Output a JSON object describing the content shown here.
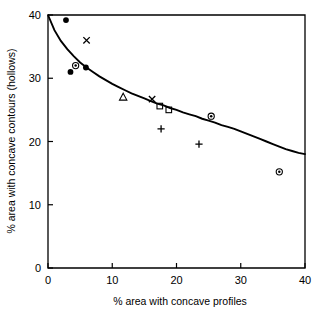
{
  "chart_data": {
    "type": "scatter",
    "title": "",
    "xlabel": "% area with concave profiles",
    "ylabel": "% area with concave contours (hollows)",
    "xlim": [
      0,
      40
    ],
    "ylim": [
      0,
      40
    ],
    "xticks": [
      0,
      10,
      20,
      30,
      40
    ],
    "yticks": [
      0,
      10,
      20,
      30,
      40
    ],
    "xtick_labels": [
      "0",
      "10",
      "20",
      "30",
      "40"
    ],
    "ytick_labels": [
      "0",
      "10",
      "20",
      "30",
      "40"
    ],
    "grid": false,
    "legend": "none",
    "points": [
      {
        "x": 2.8,
        "y": 39.2,
        "marker": "filled-circle"
      },
      {
        "x": 3.5,
        "y": 31.0,
        "marker": "filled-circle"
      },
      {
        "x": 4.3,
        "y": 32.0,
        "marker": "circle-dot"
      },
      {
        "x": 5.9,
        "y": 31.7,
        "marker": "filled-circle"
      },
      {
        "x": 6.0,
        "y": 36.0,
        "marker": "cross"
      },
      {
        "x": 11.7,
        "y": 27.0,
        "marker": "open-triangle"
      },
      {
        "x": 16.2,
        "y": 26.7,
        "marker": "cross"
      },
      {
        "x": 17.4,
        "y": 25.6,
        "marker": "open-square"
      },
      {
        "x": 18.8,
        "y": 25.0,
        "marker": "open-square"
      },
      {
        "x": 17.6,
        "y": 22.0,
        "marker": "plus"
      },
      {
        "x": 23.5,
        "y": 19.6,
        "marker": "plus"
      },
      {
        "x": 25.4,
        "y": 24.0,
        "marker": "circle-dot"
      },
      {
        "x": 36.0,
        "y": 15.2,
        "marker": "circle-dot"
      }
    ],
    "fit_curve": {
      "description": "decreasing power-law trend line",
      "points": [
        {
          "x": 0.0,
          "y": 40.0
        },
        {
          "x": 1.0,
          "y": 37.6
        },
        {
          "x": 2.0,
          "y": 35.9
        },
        {
          "x": 3.0,
          "y": 34.6
        },
        {
          "x": 4.0,
          "y": 33.5
        },
        {
          "x": 5.0,
          "y": 32.5
        },
        {
          "x": 6.0,
          "y": 31.7
        },
        {
          "x": 7.0,
          "y": 31.0
        },
        {
          "x": 8.0,
          "y": 30.3
        },
        {
          "x": 9.0,
          "y": 29.7
        },
        {
          "x": 10.0,
          "y": 29.1
        },
        {
          "x": 11.0,
          "y": 28.6
        },
        {
          "x": 12.0,
          "y": 28.1
        },
        {
          "x": 13.0,
          "y": 27.6
        },
        {
          "x": 14.0,
          "y": 27.2
        },
        {
          "x": 15.0,
          "y": 26.8
        },
        {
          "x": 16.0,
          "y": 26.4
        },
        {
          "x": 17.0,
          "y": 26.0
        },
        {
          "x": 18.0,
          "y": 25.7
        },
        {
          "x": 19.0,
          "y": 25.3
        },
        {
          "x": 20.0,
          "y": 25.0
        },
        {
          "x": 21.0,
          "y": 24.6
        },
        {
          "x": 22.0,
          "y": 24.3
        },
        {
          "x": 23.0,
          "y": 24.0
        },
        {
          "x": 24.0,
          "y": 23.6
        },
        {
          "x": 25.0,
          "y": 23.3
        },
        {
          "x": 26.0,
          "y": 23.0
        },
        {
          "x": 27.0,
          "y": 22.6
        },
        {
          "x": 28.0,
          "y": 22.3
        },
        {
          "x": 29.0,
          "y": 22.0
        },
        {
          "x": 30.0,
          "y": 21.6
        },
        {
          "x": 31.0,
          "y": 21.2
        },
        {
          "x": 32.0,
          "y": 20.8
        },
        {
          "x": 33.0,
          "y": 20.4
        },
        {
          "x": 34.0,
          "y": 20.0
        },
        {
          "x": 35.0,
          "y": 19.6
        },
        {
          "x": 36.0,
          "y": 19.2
        },
        {
          "x": 37.0,
          "y": 18.8
        },
        {
          "x": 38.0,
          "y": 18.5
        },
        {
          "x": 39.0,
          "y": 18.2
        },
        {
          "x": 40.0,
          "y": 18.0
        }
      ]
    }
  }
}
